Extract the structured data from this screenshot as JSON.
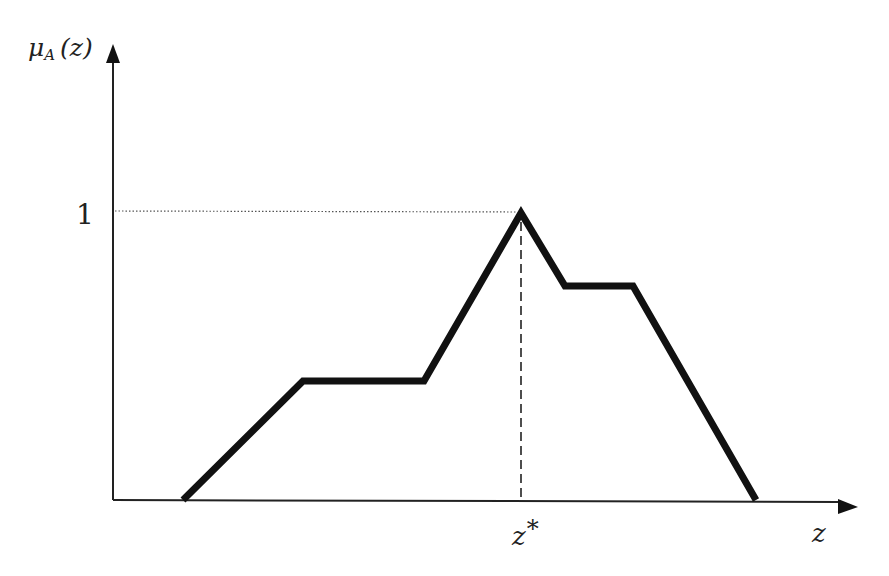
{
  "chart_data": {
    "type": "line",
    "title": "",
    "xlabel": "z",
    "ylabel": "μA (z)",
    "y_label_parts": {
      "mu": "μ",
      "sub": "A",
      "arg": "(z)"
    },
    "x_tick_labels": [
      {
        "label": "z*",
        "main": "z",
        "sup": "*",
        "x_value": 0.5
      }
    ],
    "y_tick_labels": [
      {
        "label": "1",
        "y_value": 1
      }
    ],
    "series": [
      {
        "name": "membership function",
        "points": [
          {
            "x": 0.11,
            "y": 0
          },
          {
            "x": 0.29,
            "y": 0.41
          },
          {
            "x": 0.44,
            "y": 0.41
          },
          {
            "x": 0.5,
            "y": 1
          },
          {
            "x": 0.56,
            "y": 0.74
          },
          {
            "x": 0.65,
            "y": 0.74
          },
          {
            "x": 0.81,
            "y": 0
          }
        ]
      }
    ],
    "annotations": [
      {
        "type": "dotted-hline",
        "y": 1,
        "from_x": 0,
        "to_x": 0.5
      },
      {
        "type": "dashed-vline",
        "x": 0.5,
        "from_y": 0,
        "to_y": 1
      }
    ],
    "grid": false,
    "legend": null,
    "ylim": [
      0,
      1.35
    ],
    "xlim": [
      0,
      1
    ]
  },
  "pixels": {
    "origin": {
      "x": 113,
      "y": 500
    },
    "x_axis_end": 858,
    "y_axis_top": 45,
    "polyline": [
      [
        183,
        500
      ],
      [
        303,
        381
      ],
      [
        424,
        381
      ],
      [
        521,
        213
      ],
      [
        565,
        286
      ],
      [
        633,
        286
      ],
      [
        756,
        500
      ]
    ],
    "one_level_y": 211,
    "zstar_x": 521
  },
  "colors": {
    "curve": "#111111",
    "axis": "#222222",
    "guide": "#555555"
  }
}
